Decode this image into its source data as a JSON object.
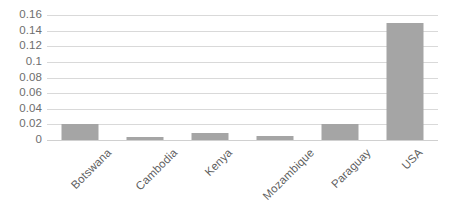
{
  "chart_data": {
    "type": "bar",
    "title": "",
    "subtitle": "",
    "xlabel": "",
    "ylabel": "",
    "categories": [
      "Botswana",
      "Cambodia",
      "Kenya",
      "Mozambique",
      "Paraguay",
      "USA"
    ],
    "values": [
      0.02,
      0.004,
      0.009,
      0.005,
      0.02,
      0.15
    ],
    "ylim": [
      0,
      0.16
    ],
    "ytick_labels": [
      "0.16",
      "0.14",
      "0.12",
      "0.1",
      "0.08",
      "0.06",
      "0.04",
      "0.02",
      "0"
    ],
    "ytick_values": [
      0.16,
      0.14,
      0.12,
      0.1,
      0.08,
      0.06,
      0.04,
      0.02,
      0
    ],
    "grid": "horizontal",
    "legend": "none",
    "series": [
      {
        "name": "Series 1",
        "values": [
          0.02,
          0.004,
          0.009,
          0.005,
          0.02,
          0.15
        ]
      }
    ],
    "annotations": [],
    "colors": {
      "bar_fill": "#a5a5a5",
      "gridline": "#d9d9d9",
      "axis_text": "#6e6e6e",
      "category_text": "#5f5f5f",
      "background": "#ffffff"
    }
  }
}
